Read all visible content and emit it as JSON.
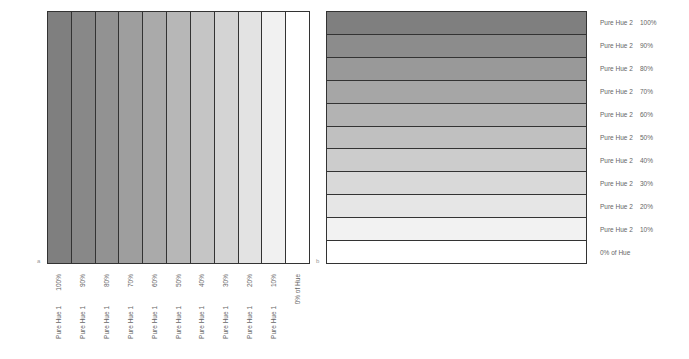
{
  "panel_a": {
    "label": "a",
    "columns": [
      {
        "pct": "100%",
        "hue": "Pure Hue 1",
        "color": "#7f7f7f"
      },
      {
        "pct": "90%",
        "hue": "Pure Hue 1",
        "color": "#888888"
      },
      {
        "pct": "80%",
        "hue": "Pure Hue 1",
        "color": "#929292"
      },
      {
        "pct": "70%",
        "hue": "Pure Hue 1",
        "color": "#9e9e9e"
      },
      {
        "pct": "60%",
        "hue": "Pure Hue 1",
        "color": "#aaaaaa"
      },
      {
        "pct": "50%",
        "hue": "Pure Hue 1",
        "color": "#b7b7b7"
      },
      {
        "pct": "40%",
        "hue": "Pure Hue 1",
        "color": "#c5c5c5"
      },
      {
        "pct": "30%",
        "hue": "Pure Hue 1",
        "color": "#d4d4d4"
      },
      {
        "pct": "20%",
        "hue": "Pure Hue 1",
        "color": "#e3e3e3"
      },
      {
        "pct": "10%",
        "hue": "Pure Hue 1",
        "color": "#f1f1f1"
      },
      {
        "pct": "0% of Hue",
        "hue": "",
        "color": "#ffffff"
      }
    ]
  },
  "panel_b": {
    "label": "b",
    "rows": [
      {
        "hue": "Pure Hue 2",
        "pct": "100%",
        "color": "#7f7f7f"
      },
      {
        "hue": "Pure Hue 2",
        "pct": "90%",
        "color": "#8c8c8c"
      },
      {
        "hue": "Pure Hue 2",
        "pct": "80%",
        "color": "#999999"
      },
      {
        "hue": "Pure Hue 2",
        "pct": "70%",
        "color": "#a6a6a6"
      },
      {
        "hue": "Pure Hue 2",
        "pct": "60%",
        "color": "#b3b3b3"
      },
      {
        "hue": "Pure Hue 2",
        "pct": "50%",
        "color": "#c0c0c0"
      },
      {
        "hue": "Pure Hue 2",
        "pct": "40%",
        "color": "#cccccc"
      },
      {
        "hue": "Pure Hue 2",
        "pct": "30%",
        "color": "#d9d9d9"
      },
      {
        "hue": "Pure Hue 2",
        "pct": "20%",
        "color": "#e6e6e6"
      },
      {
        "hue": "Pure Hue 2",
        "pct": "10%",
        "color": "#f2f2f2"
      },
      {
        "hue": "0% of Hue",
        "pct": "",
        "color": "#ffffff"
      }
    ]
  }
}
